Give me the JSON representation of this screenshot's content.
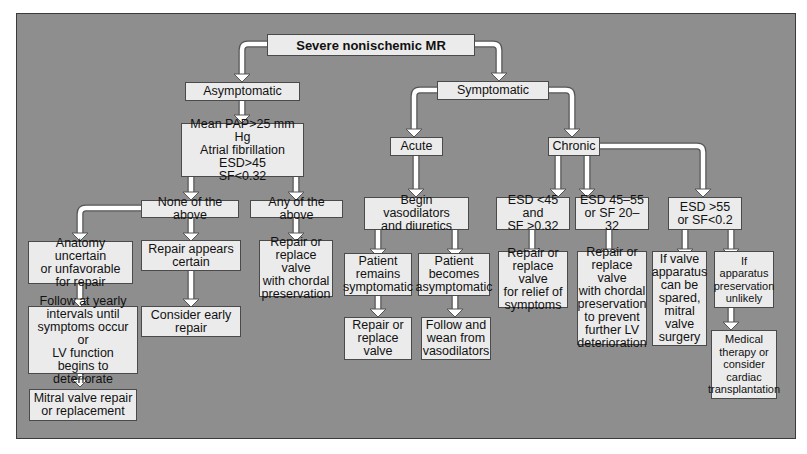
{
  "diagram": {
    "title": "Severe nonischemic MR",
    "colors": {
      "background": "#8e8e8e",
      "box_fill": "#ebebeb",
      "box_border": "#4a4a4a",
      "arrow_fill": "#ffffff",
      "arrow_stroke": "#555555"
    },
    "nodes": {
      "root": "Severe nonischemic MR",
      "asymptomatic": "Asymptomatic",
      "symptomatic": "Symptomatic",
      "criteria": "Mean PAP>25 mm Hg\nAtrial fibrillation\nESD>45\nSF<0.32",
      "none_above": "None of the above",
      "any_above": "Any of the above",
      "anatomy_uncertain": "Anatomy uncertain\nor unfavorable\nfor repair",
      "repair_certain": "Repair appears\ncertain",
      "repair_chordal_any": "Repair or\nreplace valve\nwith chordal\npreservation",
      "follow_yearly": "Follow at yearly\nintervals until\nsymptoms occur or\nLV function\nbegins to deteriorate",
      "consider_early": "Consider early\nrepair",
      "mitral_repair": "Mitral valve repair\nor replacement",
      "acute": "Acute",
      "chronic": "Chronic",
      "begin_vaso": "Begin vasodilators\nand diuretics",
      "remains_symptomatic": "Patient\nremains\nsymptomatic",
      "becomes_asymptomatic": "Patient\nbecomes\nasymptomatic",
      "repair_replace_valve": "Repair or\nreplace\nvalve",
      "follow_wean": "Follow and\nwean from\nvasodilators",
      "esd_lt45": "ESD <45 and\nSF >0.32",
      "esd_45_55": "ESD 45–55\nor SF 20–32",
      "esd_gt55": "ESD >55\nor SF<0.2",
      "repair_relief": "Repair or\nreplace valve\nfor relief of\nsymptoms",
      "repair_chordal_prevent": "Repair or\nreplace valve\nwith chordal\npreservation\nto prevent\nfurther LV\ndeterioration",
      "valve_spared": "If valve\napparatus\ncan be\nspared,\nmitral\nvalve\nsurgery",
      "preservation_unlikely": "If\napparatus\npreservation\nunlikely",
      "medical_therapy": "Medical\ntherapy or\nconsider\ncardiac\ntransplantation"
    }
  }
}
